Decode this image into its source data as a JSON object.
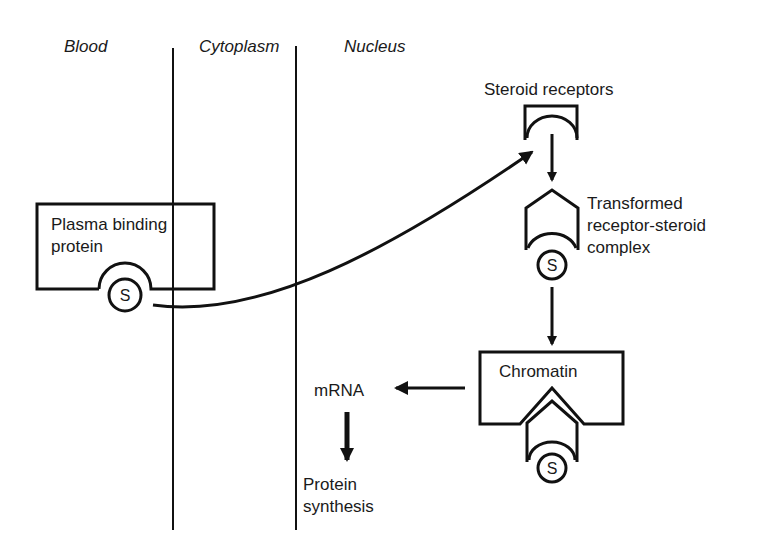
{
  "compartments": {
    "blood": "Blood",
    "cytoplasm": "Cytoplasm",
    "nucleus": "Nucleus"
  },
  "nodes": {
    "plasma_binding_protein": [
      "Plasma binding",
      "protein"
    ],
    "steroid_receptors": "Steroid receptors",
    "transformed_complex": [
      "Transformed",
      "receptor-steroid",
      "complex"
    ],
    "chromatin": "Chromatin",
    "mrna": "mRNA",
    "protein_synthesis": [
      "Protein",
      "synthesis"
    ]
  },
  "steroid_symbol": "S",
  "edges": [
    {
      "from": "plasma_binding_protein",
      "to": "steroid_receptors",
      "style": "curved"
    },
    {
      "from": "steroid_receptors",
      "to": "transformed_complex"
    },
    {
      "from": "transformed_complex",
      "to": "chromatin"
    },
    {
      "from": "chromatin",
      "to": "mrna"
    },
    {
      "from": "mrna",
      "to": "protein_synthesis"
    }
  ]
}
